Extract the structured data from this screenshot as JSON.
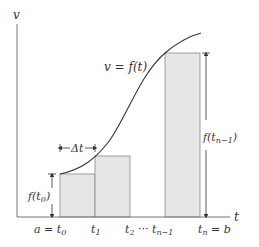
{
  "diagram": {
    "axes": {
      "y_label": "v",
      "x_label": "t"
    },
    "curve_label": "v = f(t)",
    "delta_label": "Δt",
    "left_height_label": {
      "main": "f(t",
      "sub": "0",
      "close": ")"
    },
    "right_height_label": {
      "main": "f(t",
      "sub": "n−1",
      "close": ")"
    },
    "ticks": [
      {
        "main": "a = t",
        "sub": "0"
      },
      {
        "main": "t",
        "sub": "1"
      },
      {
        "main": "t",
        "sub": "2"
      },
      {
        "main": "··· t",
        "sub": "n−1"
      },
      {
        "main": "t",
        "sub": "n",
        "suffix": " = b"
      }
    ],
    "colors": {
      "bar_fill": "#e6e6e6",
      "bar_stroke": "#888888",
      "curve": "#333333",
      "axis": "#777777"
    }
  }
}
